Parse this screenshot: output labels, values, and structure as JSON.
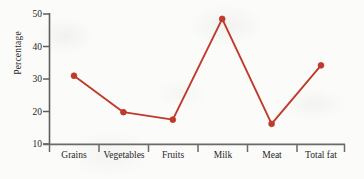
{
  "chart_data": {
    "type": "line",
    "title": "",
    "subtitle": "",
    "xlabel": "",
    "ylabel": "Percentage",
    "categories": [
      "Grains",
      "Vegetables",
      "Fruits",
      "Milk",
      "Meat",
      "Total fat"
    ],
    "values": [
      31,
      19.8,
      17.5,
      48.5,
      16.2,
      34.2
    ],
    "series": [
      {
        "name": "Percentage",
        "values": [
          31,
          19.8,
          17.5,
          48.5,
          16.2,
          34.2
        ]
      }
    ],
    "ylim": [
      10,
      50
    ],
    "yticks": [
      10,
      20,
      30,
      40,
      50
    ],
    "ytick_labels": [
      "10",
      "20",
      "30",
      "40",
      "50"
    ],
    "grid": false,
    "legend": false,
    "legend_position": "none",
    "marker": "circle",
    "line_color": "#bf3a2b",
    "marker_color": "#c0392b",
    "axis_color": "#595959",
    "background": "#fbfbf9"
  },
  "axes": {
    "y_axis_label": "Percentage",
    "y_tick_labels": [
      "10",
      "20",
      "30",
      "40",
      "50"
    ],
    "x_tick_labels": [
      "Grains",
      "Vegetables",
      "Fruits",
      "Milk",
      "Meat",
      "Total fat"
    ]
  }
}
